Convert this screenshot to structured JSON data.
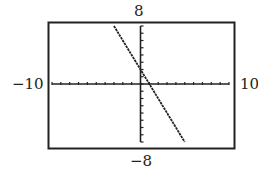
{
  "chart_data": {
    "type": "line",
    "title": "",
    "xlabel": "",
    "ylabel": "",
    "xlim": [
      -10,
      10
    ],
    "ylim": [
      -8,
      8
    ],
    "xscale": 1,
    "yscale": 1,
    "grid": false,
    "series": [
      {
        "name": "y = -2x + 2",
        "x": [
          -3,
          5
        ],
        "y": [
          8,
          -8
        ]
      }
    ],
    "window_labels": {
      "ymax": "8",
      "ymin": "−8",
      "xmin": "−10",
      "xmax": "10"
    }
  }
}
